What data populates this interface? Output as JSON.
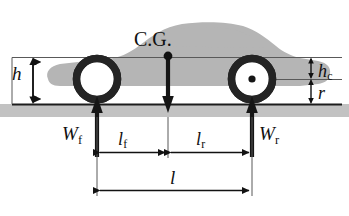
{
  "figure": {
    "type": "engineering-diagram",
    "colors": {
      "car_body": "#b3b3b3",
      "ground_band": "#c0c0c0",
      "line": "#1a1a1a",
      "thin_line": "#555555",
      "wheel": "#262626",
      "wheel_inner": "#ffffff",
      "background": "#ffffff"
    }
  },
  "labels": {
    "cg": "C.G.",
    "height_cg": "h",
    "wheel_center_height": "h",
    "wheel_center_height_sub": "c",
    "wheel_radius": "r",
    "front_load": "W",
    "front_load_sub": "f",
    "rear_load": "W",
    "rear_load_sub": "r",
    "dist_front": "l",
    "dist_front_sub": "f",
    "dist_rear": "l",
    "dist_rear_sub": "r",
    "wheelbase": "l"
  },
  "geometry": {
    "ground_line_y": 104,
    "cg_line_y": 57,
    "axle_line_y": 79,
    "front_axle_x": 97,
    "rear_axle_x": 252,
    "cg_x": 168,
    "wheel_outer_radius": 21,
    "wheel_inner_radius": 14
  },
  "annotations": [
    {
      "name": "h",
      "meaning": "height of C.G. above ground",
      "from_y": 57,
      "to_y": 104,
      "at_x": 33
    },
    {
      "name": "h_c",
      "meaning": "height from C.G. line down to wheel center",
      "from_y": 57,
      "to_y": 79,
      "at_x": 311
    },
    {
      "name": "r",
      "meaning": "wheel radius",
      "from_y": 79,
      "to_y": 104,
      "at_x": 311
    },
    {
      "name": "W_f",
      "meaning": "front axle reaction force",
      "direction": "up",
      "at_x": 97
    },
    {
      "name": "W_r",
      "meaning": "rear axle reaction force",
      "direction": "up",
      "at_x": 252
    },
    {
      "name": "W",
      "meaning": "weight at center of gravity",
      "direction": "down",
      "at_x": 168
    },
    {
      "name": "l_f",
      "meaning": "distance front axle to C.G.",
      "from_x": 97,
      "to_x": 168,
      "at_y": 152
    },
    {
      "name": "l_r",
      "meaning": "distance C.G. to rear axle",
      "from_x": 168,
      "to_x": 252,
      "at_y": 152
    },
    {
      "name": "l",
      "meaning": "wheelbase",
      "from_x": 97,
      "to_x": 252,
      "at_y": 189
    }
  ]
}
